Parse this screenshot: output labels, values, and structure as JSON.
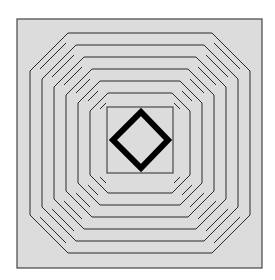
{
  "figure": {
    "colors": {
      "background": "#ffffff",
      "fill": "#dcdcdc",
      "line": "#2a2a2a",
      "diamond": "#000000"
    },
    "outer_square": {
      "x": 17,
      "y": 19,
      "w": 245,
      "h": 249
    },
    "inner_square": {
      "x": 107,
      "y": 107,
      "w": 66,
      "h": 66
    },
    "ring_count": 6
  }
}
